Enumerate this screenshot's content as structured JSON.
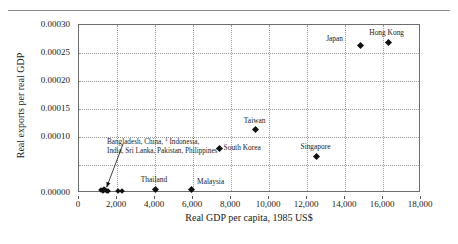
{
  "chart_data": {
    "type": "scatter",
    "title": "",
    "xlabel": "Real GDP per capita, 1985 US$",
    "ylabel": "Real exports per real GDP",
    "xlim": [
      0,
      18000
    ],
    "ylim": [
      0.0,
      0.0003
    ],
    "grid": true,
    "legend": "none",
    "xticks": [
      "0",
      "2,000",
      "4,000",
      "6,000",
      "8,000",
      "10,000",
      "12,000",
      "14,000",
      "16,000",
      "18,000"
    ],
    "xtick_values": [
      0,
      2000,
      4000,
      6000,
      8000,
      10000,
      12000,
      14000,
      16000,
      18000
    ],
    "yticks": [
      "0.00000",
      "",
      "0.00010",
      "0.00015",
      "0.00020",
      "0.00025",
      "0.00030"
    ],
    "ytick_values": [
      0.0,
      5e-05,
      0.0001,
      0.00015,
      0.0002,
      0.00025,
      0.0003
    ],
    "points": [
      {
        "name": "Hong Kong",
        "x": 16300,
        "y": 0.000268,
        "label": "Hong Kong",
        "label_dx": -2,
        "label_dy": -14,
        "label_align": "center"
      },
      {
        "name": "Japan",
        "x": 14800,
        "y": 0.000264,
        "label": "Japan",
        "label_dx": -34,
        "label_dy": -10,
        "label_align": "left"
      },
      {
        "name": "Taiwan",
        "x": 9300,
        "y": 0.000113,
        "label": "Taiwan",
        "label_dx": -1,
        "label_dy": -13,
        "label_align": "center"
      },
      {
        "name": "Singapore",
        "x": 12500,
        "y": 6.55e-05,
        "label": "Singapore",
        "label_dx": -1,
        "label_dy": -13,
        "label_align": "center"
      },
      {
        "name": "South Korea",
        "x": 7400,
        "y": 7.95e-05,
        "label": "South Korea",
        "label_dx": 4,
        "label_dy": -4,
        "label_align": "left"
      },
      {
        "name": "Malaysia",
        "x": 5900,
        "y": 5.5e-06,
        "label": "Malaysia",
        "label_dx": 6,
        "label_dy": -12,
        "label_align": "left"
      },
      {
        "name": "Thailand",
        "x": 4000,
        "y": 5.5e-06,
        "label": "Thailand",
        "label_dx": -1,
        "label_dy": -14,
        "label_align": "center"
      },
      {
        "name": "cluster-a",
        "x": 1250,
        "y": 4e-06,
        "label": "",
        "label_dx": 0,
        "label_dy": 0,
        "label_align": "center"
      },
      {
        "name": "cluster-b",
        "x": 1350,
        "y": 4.5e-06,
        "label": "",
        "label_dx": 0,
        "label_dy": 0,
        "label_align": "center"
      },
      {
        "name": "cluster-c",
        "x": 1450,
        "y": 4e-06,
        "label": "",
        "label_dx": 0,
        "label_dy": 0,
        "label_align": "center"
      },
      {
        "name": "cluster-d",
        "x": 1150,
        "y": 4.5e-06,
        "label": "",
        "label_dx": 0,
        "label_dy": 0,
        "label_align": "center"
      },
      {
        "name": "cluster-e",
        "x": 1550,
        "y": 4.2e-06,
        "label": "",
        "label_dx": 0,
        "label_dy": 0,
        "label_align": "center"
      },
      {
        "name": "cluster-f",
        "x": 1320,
        "y": 7.5e-06,
        "label": "",
        "label_dx": 0,
        "label_dy": 0,
        "label_align": "center"
      },
      {
        "name": "cluster-g",
        "x": 2050,
        "y": 4e-06,
        "label": "",
        "label_dx": 0,
        "label_dy": 0,
        "label_align": "center"
      },
      {
        "name": "cluster-h",
        "x": 2250,
        "y": 4.2e-06,
        "label": "",
        "label_dx": 0,
        "label_dy": 0,
        "label_align": "center"
      }
    ],
    "annotations": [
      {
        "name": "cluster-countries",
        "line1": "Bangladesh, China,",
        "line1_footnote": "1",
        "line1_rest": "Indonesia,",
        "line2": "India, Sri Lanka, Pakistan, Philippines",
        "points_to_x": 1350,
        "points_to_y": 8.5e-06
      }
    ]
  }
}
